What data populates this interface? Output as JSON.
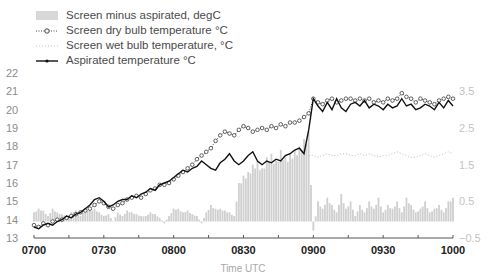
{
  "chart_data": {
    "type": "line",
    "title": "",
    "xlabel": "Time UTC",
    "ylabel": "",
    "x_ticks": [
      "0700",
      "0730",
      "0800",
      "0830",
      "0900",
      "0930",
      "1000"
    ],
    "y_ticks_left": [
      "13",
      "14",
      "15",
      "16",
      "17",
      "18",
      "19",
      "20",
      "21",
      "22"
    ],
    "y_ticks_right": [
      "-0.5",
      "0.5",
      "1.5",
      "2.5",
      "3.5"
    ],
    "ylim_left": [
      13,
      22
    ],
    "ylim_right": [
      -0.5,
      4.0
    ],
    "legend_position": "top-left",
    "grid": false,
    "x_minutes": [
      0,
      2,
      4,
      6,
      8,
      10,
      12,
      14,
      16,
      18,
      20,
      22,
      24,
      26,
      28,
      30,
      32,
      34,
      36,
      38,
      40,
      42,
      44,
      46,
      48,
      50,
      52,
      54,
      56,
      58,
      60,
      62,
      64,
      66,
      68,
      70,
      72,
      74,
      76,
      78,
      80,
      82,
      84,
      86,
      88,
      90,
      92,
      94,
      96,
      98,
      100,
      102,
      104,
      106,
      108,
      110,
      112,
      114,
      116,
      118,
      120,
      122,
      124,
      126,
      128,
      130,
      132,
      134,
      136,
      138,
      140,
      142,
      144,
      146,
      148,
      150,
      152,
      154,
      156,
      158,
      160,
      162,
      164,
      166,
      168,
      170,
      172,
      174,
      176,
      178,
      180
    ],
    "series": [
      {
        "name": "Screen minus aspirated, degC",
        "axis": "right",
        "style": "bar",
        "values": [
          0.2,
          0.3,
          0.25,
          0.1,
          0.3,
          0.2,
          0.15,
          0.1,
          0.2,
          0.25,
          0.1,
          0.3,
          0.25,
          0.3,
          0.2,
          0.1,
          0.15,
          -0.05,
          0.2,
          0.1,
          0.25,
          0.2,
          0.15,
          0.1,
          0.1,
          0.2,
          0.15,
          0.05,
          -0.1,
          0.1,
          0.3,
          0.3,
          0.2,
          0.25,
          0.15,
          0.1,
          -0.1,
          0.2,
          0.4,
          0.3,
          0.3,
          0.25,
          0.2,
          0.1,
          1.0,
          1.2,
          1.3,
          1.5,
          1.6,
          1.4,
          1.7,
          1.8,
          1.6,
          1.9,
          1.7,
          1.8,
          1.9,
          2.0,
          2.2,
          2.4,
          -0.3,
          0.5,
          0.3,
          0.6,
          0.4,
          0.2,
          0.7,
          0.3,
          0.5,
          0.1,
          0.4,
          0.2,
          0.5,
          0.3,
          0.6,
          0.2,
          0.4,
          0.3,
          0.5,
          0.2,
          0.6,
          0.4,
          0.2,
          0.3,
          0.5,
          0.2,
          0.3,
          0.4,
          0.2,
          0.5,
          0.6
        ],
        "color": "#cfcfcf"
      },
      {
        "name": "Screen dry bulb temperature °C",
        "axis": "left",
        "style": "dotted-circle",
        "values": [
          13.7,
          13.6,
          13.8,
          13.7,
          13.9,
          14.0,
          14.0,
          14.1,
          14.2,
          14.3,
          14.4,
          14.5,
          14.6,
          14.8,
          15.0,
          14.9,
          14.7,
          14.6,
          14.8,
          14.9,
          15.1,
          15.2,
          15.3,
          15.2,
          15.4,
          15.6,
          15.7,
          15.9,
          15.9,
          16.0,
          16.2,
          16.4,
          16.6,
          16.8,
          17.0,
          17.3,
          17.5,
          17.7,
          17.9,
          18.3,
          18.6,
          18.8,
          18.7,
          18.6,
          18.9,
          19.1,
          19.0,
          18.8,
          18.9,
          19.0,
          18.9,
          19.1,
          19.0,
          19.2,
          19.1,
          19.3,
          19.3,
          19.4,
          19.6,
          19.8,
          20.6,
          20.4,
          20.3,
          20.5,
          20.6,
          20.4,
          20.5,
          20.6,
          20.6,
          20.5,
          20.6,
          20.5,
          20.6,
          20.4,
          20.5,
          20.4,
          20.6,
          20.5,
          20.6,
          20.9,
          20.7,
          20.6,
          20.4,
          20.6,
          20.5,
          20.4,
          20.3,
          20.5,
          20.6,
          20.7,
          20.6
        ],
        "color": "#3a3a3a"
      },
      {
        "name": "Screen wet bulb temperature, °C",
        "axis": "left",
        "style": "dotted",
        "values": [
          null,
          null,
          null,
          null,
          null,
          null,
          null,
          null,
          null,
          null,
          null,
          null,
          null,
          null,
          null,
          null,
          null,
          null,
          null,
          null,
          null,
          null,
          null,
          null,
          null,
          null,
          null,
          null,
          null,
          null,
          null,
          null,
          null,
          null,
          null,
          null,
          null,
          null,
          null,
          null,
          null,
          null,
          null,
          null,
          null,
          null,
          null,
          null,
          null,
          null,
          null,
          null,
          null,
          null,
          null,
          null,
          null,
          null,
          null,
          17.5,
          17.5,
          17.4,
          17.5,
          17.6,
          17.5,
          17.5,
          17.6,
          17.6,
          17.5,
          17.5,
          17.6,
          17.5,
          17.6,
          17.5,
          17.4,
          17.5,
          17.5,
          17.6,
          17.7,
          17.6,
          17.5,
          17.4,
          17.4,
          17.5,
          17.6,
          17.5,
          17.4,
          17.5,
          17.6,
          17.7,
          17.6
        ],
        "color": "#bdbdbd"
      },
      {
        "name": "Aspirated temperature °C",
        "axis": "left",
        "style": "solid-marker",
        "values": [
          13.6,
          13.5,
          13.7,
          13.8,
          13.7,
          13.9,
          14.0,
          14.2,
          14.1,
          14.3,
          14.4,
          14.6,
          14.8,
          15.1,
          15.2,
          15.0,
          14.7,
          14.8,
          15.0,
          15.1,
          15.1,
          15.3,
          15.2,
          15.4,
          15.5,
          15.7,
          15.6,
          15.9,
          16.0,
          16.1,
          16.3,
          16.5,
          16.7,
          16.6,
          16.8,
          16.9,
          17.2,
          17.0,
          16.8,
          16.7,
          17.1,
          17.3,
          17.6,
          17.2,
          17.0,
          17.2,
          17.5,
          17.7,
          17.2,
          17.0,
          17.2,
          17.1,
          17.3,
          17.2,
          17.5,
          17.6,
          17.8,
          17.9,
          17.6,
          18.9,
          20.6,
          20.2,
          19.9,
          20.4,
          20.0,
          20.6,
          20.1,
          19.9,
          20.3,
          20.4,
          20.2,
          20.5,
          20.1,
          20.3,
          20.2,
          20.0,
          20.3,
          20.1,
          20.2,
          20.6,
          20.2,
          20.3,
          20.0,
          20.1,
          20.3,
          20.2,
          20.0,
          20.4,
          20.1,
          20.5,
          20.2
        ],
        "color": "#111111"
      }
    ]
  },
  "legend": {
    "items": [
      {
        "label": "Screen minus aspirated, degC"
      },
      {
        "label": "Screen dry bulb temperature °C"
      },
      {
        "label": "Screen wet bulb temperature, °C"
      },
      {
        "label": "Aspirated temperature °C"
      }
    ]
  },
  "axes": {
    "xlabel": "Time UTC"
  }
}
